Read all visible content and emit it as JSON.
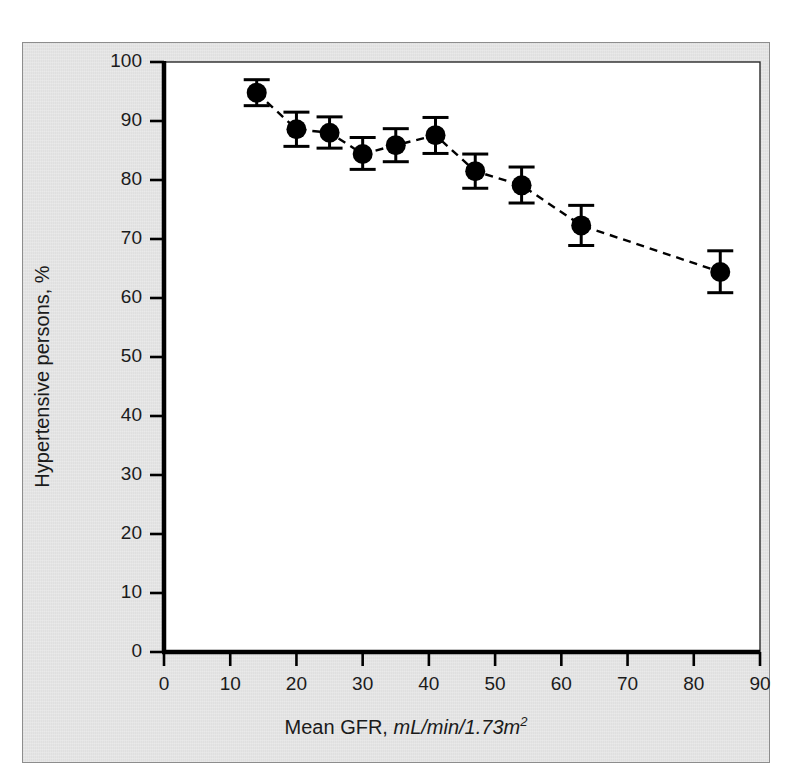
{
  "figure": {
    "background_color": "#e3e3e3",
    "plot_background_color": "#ffffff",
    "axis_color": "#000000",
    "marker_color": "#000000"
  },
  "chart_data": {
    "type": "scatter",
    "title": "",
    "xlabel_plain": "Mean GFR, ",
    "xlabel_italic": "mL/min/1.73m",
    "xlabel_superscript": "2",
    "ylabel": "Hypertensive persons, %",
    "xlim": [
      0,
      90
    ],
    "ylim": [
      0,
      100
    ],
    "xticks": [
      0,
      10,
      20,
      30,
      40,
      50,
      60,
      70,
      80,
      90
    ],
    "xtick_labels": [
      "0",
      "10",
      "20",
      "30",
      "40",
      "50",
      "60",
      "70",
      "80",
      "90"
    ],
    "yticks": [
      0,
      10,
      20,
      30,
      40,
      50,
      60,
      70,
      80,
      90,
      100
    ],
    "ytick_labels": [
      "0",
      "10",
      "20",
      "30",
      "40",
      "50",
      "60",
      "70",
      "80",
      "90",
      "100"
    ],
    "grid": false,
    "legend": null,
    "line_style": "dashed",
    "error_bars": true,
    "x": [
      14,
      20,
      25,
      30,
      35,
      41,
      47,
      54,
      63,
      84
    ],
    "y": [
      94.8,
      88.6,
      88.0,
      84.4,
      85.9,
      87.6,
      81.5,
      79.1,
      72.3,
      64.4
    ],
    "yerr_low": [
      92.6,
      85.7,
      85.4,
      81.8,
      83.1,
      84.5,
      78.6,
      76.1,
      68.9,
      60.9
    ],
    "yerr_high": [
      97.0,
      91.5,
      90.7,
      87.2,
      88.7,
      90.6,
      84.4,
      82.2,
      75.7,
      68.0
    ]
  }
}
